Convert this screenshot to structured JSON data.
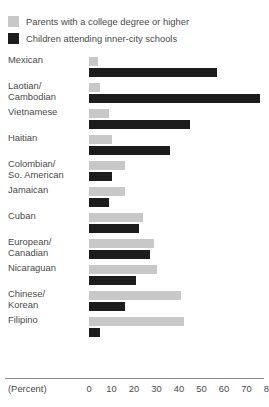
{
  "legend": {
    "items": [
      {
        "label": "Parents with a college degree or higher",
        "color": "#c8c8c8",
        "key": "parents"
      },
      {
        "label": "Children attending inner-city schools",
        "color": "#1c1c1c",
        "key": "children"
      }
    ]
  },
  "axis": {
    "unit_label": "(Percent)",
    "ticks": [
      "0",
      "10",
      "20",
      "30",
      "40",
      "50",
      "60",
      "70",
      "80"
    ]
  },
  "chart_data": {
    "type": "bar",
    "orientation": "horizontal",
    "title": "",
    "xlabel": "(Percent)",
    "ylabel": "",
    "xlim": [
      0,
      80
    ],
    "xticks": [
      0,
      10,
      20,
      30,
      40,
      50,
      60,
      70,
      80
    ],
    "grid": false,
    "legend_position": "top-left",
    "categories": [
      "Mexican",
      "Laotian/ Cambodian",
      "Vietnamese",
      "Haitian",
      "Colombian/ So. American",
      "Jamaican",
      "Cuban",
      "European/ Canadian",
      "Nicaraguan",
      "Chinese/ Korean",
      "Filipino"
    ],
    "series": [
      {
        "name": "Parents with a college degree or higher",
        "color": "#c8c8c8",
        "values": [
          4,
          5,
          9,
          10,
          16,
          16,
          24,
          29,
          30,
          41,
          42
        ]
      },
      {
        "name": "Children attending inner-city schools",
        "color": "#1c1c1c",
        "values": [
          57,
          76,
          45,
          36,
          10,
          9,
          22,
          27,
          21,
          16,
          5
        ]
      }
    ]
  },
  "rows": [
    {
      "label_line1": "Mexican",
      "label_line2": ""
    },
    {
      "label_line1": "Laotian/",
      "label_line2": "Cambodian"
    },
    {
      "label_line1": "Vietnamese",
      "label_line2": ""
    },
    {
      "label_line1": "Haitian",
      "label_line2": ""
    },
    {
      "label_line1": "Colombian/",
      "label_line2": "So. American"
    },
    {
      "label_line1": "Jamaican",
      "label_line2": ""
    },
    {
      "label_line1": "Cuban",
      "label_line2": ""
    },
    {
      "label_line1": "European/",
      "label_line2": "Canadian"
    },
    {
      "label_line1": "Nicaraguan",
      "label_line2": ""
    },
    {
      "label_line1": "Chinese/",
      "label_line2": "Korean"
    },
    {
      "label_line1": "Filipino",
      "label_line2": ""
    }
  ]
}
